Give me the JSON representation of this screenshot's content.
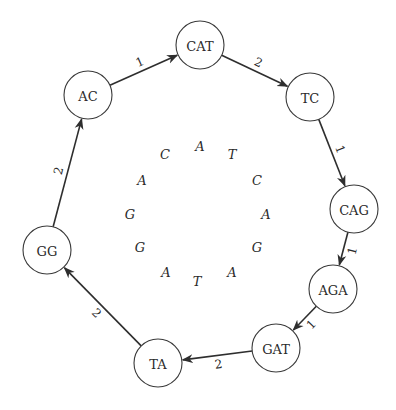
{
  "diagram": {
    "type": "de Bruijn-style cycle graph",
    "nodes": [
      {
        "id": "CAT",
        "label": "CAT",
        "x": 200,
        "y": 45
      },
      {
        "id": "TC",
        "label": "TC",
        "x": 310,
        "y": 97
      },
      {
        "id": "CAG",
        "label": "CAG",
        "x": 354,
        "y": 209
      },
      {
        "id": "AGA",
        "label": "AGA",
        "x": 333,
        "y": 289
      },
      {
        "id": "GAT",
        "label": "GAT",
        "x": 276,
        "y": 348
      },
      {
        "id": "TA",
        "label": "TA",
        "x": 158,
        "y": 363
      },
      {
        "id": "GG",
        "label": "GG",
        "x": 47,
        "y": 250
      },
      {
        "id": "AC",
        "label": "AC",
        "x": 88,
        "y": 95
      }
    ],
    "edges": [
      {
        "from": "AC",
        "to": "CAT",
        "label": "1"
      },
      {
        "from": "CAT",
        "to": "TC",
        "label": "2"
      },
      {
        "from": "TC",
        "to": "CAG",
        "label": "1"
      },
      {
        "from": "CAG",
        "to": "AGA",
        "label": "1"
      },
      {
        "from": "AGA",
        "to": "GAT",
        "label": "1"
      },
      {
        "from": "GAT",
        "to": "TA",
        "label": "2"
      },
      {
        "from": "TA",
        "to": "GG",
        "label": "2"
      },
      {
        "from": "GG",
        "to": "AC",
        "label": "2"
      }
    ],
    "node_radius": 24,
    "inner_ring_letters": [
      {
        "char": "A",
        "x": 200,
        "y": 146
      },
      {
        "char": "T",
        "x": 232,
        "y": 154
      },
      {
        "char": "C",
        "x": 257,
        "y": 180
      },
      {
        "char": "A",
        "x": 266,
        "y": 214
      },
      {
        "char": "G",
        "x": 257,
        "y": 247
      },
      {
        "char": "A",
        "x": 232,
        "y": 272
      },
      {
        "char": "T",
        "x": 197,
        "y": 281
      },
      {
        "char": "A",
        "x": 166,
        "y": 272
      },
      {
        "char": "G",
        "x": 140,
        "y": 247
      },
      {
        "char": "G",
        "x": 130,
        "y": 214
      },
      {
        "char": "A",
        "x": 142,
        "y": 180
      },
      {
        "char": "C",
        "x": 165,
        "y": 154
      }
    ],
    "colors": {
      "stroke": "#2e2e2e",
      "text": "#2a2a2a",
      "background": "#ffffff"
    }
  }
}
